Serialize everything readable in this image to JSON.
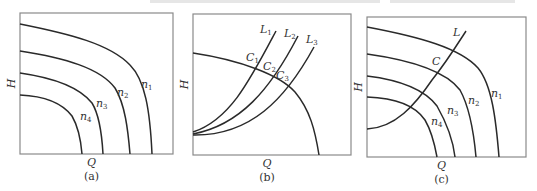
{
  "figure": {
    "top_text_cutoff": "",
    "panels": [
      {
        "id": "a",
        "caption": "(a)",
        "x_axis_label": "Q",
        "y_axis_label": "H",
        "frame": {
          "x": 20,
          "y": 13,
          "w": 153,
          "h": 141
        },
        "curves": [
          {
            "name": "n1",
            "label_main": "n",
            "label_sub": "1",
            "d": "M20,24 C70,34 110,44 130,65 C145,80 150,110 152,154",
            "label_xy": [
              141,
              88
            ]
          },
          {
            "name": "n2",
            "label_main": "n",
            "label_sub": "2",
            "d": "M20,51 C65,58 100,68 115,88 C125,104 128,130 130,154",
            "label_xy": [
              117,
              96
            ]
          },
          {
            "name": "n3",
            "label_main": "n",
            "label_sub": "3",
            "d": "M20,73 C55,78 80,88 92,103 C100,116 102,136 103,154",
            "label_xy": [
              96,
              107
            ]
          },
          {
            "name": "n4",
            "label_main": "n",
            "label_sub": "4",
            "d": "M20,95 C45,96 62,103 72,116 C79,128 81,142 82,154",
            "label_xy": [
              80,
              120
            ]
          }
        ]
      },
      {
        "id": "b",
        "caption": "(b)",
        "x_axis_label": "Q",
        "y_axis_label": "H",
        "frame": {
          "x": 193,
          "y": 14,
          "w": 158,
          "h": 141
        },
        "pump_curve": {
          "d": "M193,53 C240,60 280,75 295,92 C310,110 315,130 319,155"
        },
        "system_curves": [
          {
            "name": "L1",
            "label_main": "L",
            "label_sub": "1",
            "d": "M193,132 C230,120 250,80 276,31",
            "label_xy": [
              260,
              33
            ]
          },
          {
            "name": "L2",
            "label_main": "L",
            "label_sub": "2",
            "d": "M193,134 C240,125 270,90 298,36",
            "label_xy": [
              284,
              37
            ]
          },
          {
            "name": "L3",
            "label_main": "L",
            "label_sub": "3",
            "d": "M193,135 C250,136 285,100 314,47",
            "label_xy": [
              306,
              43
            ]
          }
        ],
        "intersections": [
          {
            "name": "C1",
            "label_main": "C",
            "label_sub": "1",
            "label_xy": [
              246,
              61
            ]
          },
          {
            "name": "C2",
            "label_main": "C",
            "label_sub": "2",
            "label_xy": [
              263,
              70
            ]
          },
          {
            "name": "C3",
            "label_main": "C",
            "label_sub": "3",
            "label_xy": [
              276,
              79
            ]
          }
        ]
      },
      {
        "id": "c",
        "caption": "(c)",
        "x_axis_label": "Q",
        "y_axis_label": "H",
        "frame": {
          "x": 367,
          "y": 17,
          "w": 159,
          "h": 140
        },
        "curves": [
          {
            "name": "n1",
            "label_main": "n",
            "label_sub": "1",
            "d": "M367,27 C420,37 460,48 478,68 C492,85 496,120 499,157",
            "label_xy": [
              491,
              97
            ]
          },
          {
            "name": "n2",
            "label_main": "n",
            "label_sub": "2",
            "d": "M367,54 C410,60 445,70 460,90 C470,108 474,135 476,157",
            "label_xy": [
              468,
              104
            ]
          },
          {
            "name": "n3",
            "label_main": "n",
            "label_sub": "3",
            "d": "M367,76 C400,80 425,90 437,106 C445,120 453,140 455,157",
            "label_xy": [
              447,
              114
            ]
          },
          {
            "name": "n4",
            "label_main": "n",
            "label_sub": "4",
            "d": "M367,97 C395,98 415,105 425,120 C432,132 435,146 437,157",
            "label_xy": [
              431,
              125
            ]
          }
        ],
        "system_curve": {
          "name": "L",
          "label_main": "L",
          "label_sub": "",
          "d": "M367,129 C395,128 415,105 432,80 C448,60 460,40 466,31",
          "label_xy": [
            453,
            36
          ]
        },
        "operating_point": {
          "name": "C",
          "label_main": "C",
          "label_sub": "",
          "label_xy": [
            432,
            65
          ]
        }
      }
    ]
  }
}
